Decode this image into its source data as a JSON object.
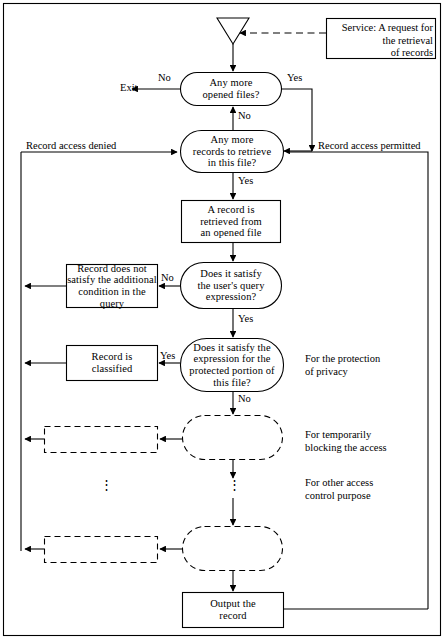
{
  "diagram": {
    "stroke_color": "#000000",
    "background_color": "#ffffff",
    "nodes": {
      "start_triangle": {
        "name": "start-connector",
        "label": ""
      },
      "service_box": {
        "label": "Service: A request for\nthe retrieval\nof records"
      },
      "any_more_opened_files": {
        "label": "Any more\nopened files?"
      },
      "any_more_records": {
        "label": "Any more\nrecords to retrieve\nin this file?"
      },
      "record_retrieved": {
        "label": "A record is\nretrieved from\nan opened file"
      },
      "query_expression_decision": {
        "label": "Does it satisfy\nthe user's query\nexpression?"
      },
      "record_not_satisfy": {
        "label": "Record does not\nsatisfy the additional\ncondition in the query"
      },
      "protected_portion_decision": {
        "label": "Does it satisfy the\nexpression for the\nprotected portion of\nthis file?"
      },
      "record_classified": {
        "label": "Record is\nclassified"
      },
      "dashed_decision_1": {
        "label": ""
      },
      "dashed_action_1": {
        "label": ""
      },
      "dashed_decision_2": {
        "label": ""
      },
      "dashed_action_2": {
        "label": ""
      },
      "output_record": {
        "label": "Output the\nrecord"
      }
    },
    "edge_labels": {
      "exit": "Exit",
      "opened_files_no": "No",
      "opened_files_yes": "Yes",
      "to_records_no": "No",
      "records_yes": "Yes",
      "query_no": "No",
      "query_yes": "Yes",
      "protected_yes": "Yes",
      "protected_no": "No",
      "record_access_denied": "Record access denied",
      "record_access_permitted": "Record access permitted"
    },
    "side_notes": {
      "privacy": "For the protection\nof privacy",
      "temporary_block": "For temporarily\nblocking the access",
      "other_purpose": "For other access\ncontrol purpose"
    },
    "ellipsis": {
      "left": "⋮",
      "center": "⋮"
    }
  }
}
